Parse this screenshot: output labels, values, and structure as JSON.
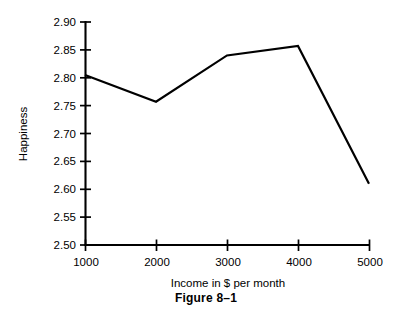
{
  "figure": {
    "caption": "Figure 8–1"
  },
  "chart_data": {
    "type": "line",
    "title": "",
    "xlabel": "Income in $ per month",
    "ylabel": "Happiness",
    "x": [
      1000,
      2000,
      3000,
      4000,
      5000
    ],
    "values": [
      2.805,
      2.757,
      2.84,
      2.857,
      2.61
    ],
    "series": [
      {
        "name": "Happiness",
        "values": [
          2.805,
          2.757,
          2.84,
          2.857,
          2.61
        ]
      }
    ],
    "xlim": [
      1000,
      5000
    ],
    "ylim": [
      2.5,
      2.9
    ],
    "x_tick_labels": [
      "1000",
      "2000",
      "3000",
      "4000",
      "5000"
    ],
    "y_tick_labels": [
      "2.50",
      "2.55",
      "2.60",
      "2.65",
      "2.70",
      "2.75",
      "2.80",
      "2.85",
      "2.90"
    ],
    "y_ticks": [
      2.5,
      2.55,
      2.6,
      2.65,
      2.7,
      2.75,
      2.8,
      2.85,
      2.9
    ],
    "grid": false,
    "legend": false,
    "line_color": "#000000"
  }
}
